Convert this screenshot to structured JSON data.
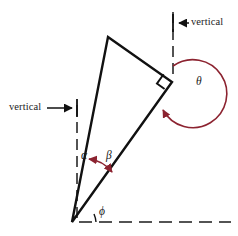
{
  "figure": {
    "name": "inclined-right-triangle-angle-diagram",
    "width": 238,
    "height": 236,
    "background_color": "#ffffff"
  },
  "colors": {
    "line": "#111111",
    "dashed": "#1b1b1b",
    "angle_arrow": "#8c2330",
    "text": "#1b1b1b"
  },
  "labels": {
    "vertical_left": "vertical",
    "vertical_right": "vertical",
    "alpha": "α",
    "beta": "β",
    "theta": "θ",
    "phi": "ϕ"
  },
  "geometry": {
    "triangle": {
      "apex_top": [
        108,
        37
      ],
      "apex_right": [
        172,
        82
      ],
      "apex_bottom": [
        72,
        222
      ],
      "right_angle_vertex": "apex_right",
      "right_angle_marker_size": 11
    },
    "reference_lines": [
      {
        "name": "left-vertical-dashed",
        "orientation": "vertical",
        "x": 77,
        "y_start": 105,
        "y_end": 223
      },
      {
        "name": "right-vertical-dashed",
        "orientation": "vertical",
        "x": 173,
        "y_start": 12,
        "y_end": 78
      },
      {
        "name": "bottom-horizontal-dashed",
        "orientation": "horizontal",
        "y": 222,
        "x_start": 78,
        "x_end": 231
      }
    ],
    "angles": [
      {
        "name": "alpha",
        "between": [
          "left-vertical-dashed",
          "triangle-left-edge"
        ],
        "vertex": [
          72,
          222
        ],
        "marker": "label-only"
      },
      {
        "name": "beta",
        "between": [
          "triangle-left-edge",
          "triangle-hypotenuse"
        ],
        "vertex": [
          72,
          222
        ],
        "marker": "double-headed-arrow"
      },
      {
        "name": "theta",
        "between": [
          "right-vertical-dashed",
          "triangle-hypotenuse"
        ],
        "vertex": [
          172,
          82
        ],
        "marker": "reflex-arc-arrow",
        "reflex": true
      },
      {
        "name": "phi",
        "between": [
          "bottom-horizontal-dashed",
          "triangle-hypotenuse"
        ],
        "vertex": [
          72,
          222
        ],
        "marker": "small-arc"
      }
    ],
    "pointer_arrows": [
      {
        "name": "vertical-left-pointer",
        "from": [
          47,
          108
        ],
        "to": [
          75,
          108
        ],
        "direction": "right"
      },
      {
        "name": "vertical-right-pointer",
        "from": [
          188,
          23
        ],
        "to": [
          176,
          23
        ],
        "direction": "left"
      }
    ]
  }
}
